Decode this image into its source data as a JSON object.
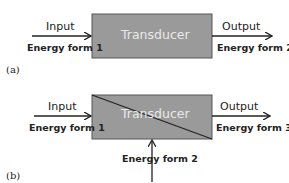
{
  "diagram_a": {
    "tag": "(a)",
    "box_label": "Transducer",
    "input_label": "Input",
    "input_energy": "Energy form 1",
    "output_label": "Output",
    "output_energy": "Energy form 2"
  },
  "diagram_b": {
    "tag": "(b)",
    "box_label": "Transducer",
    "input_label": "Input",
    "input_energy": "Energy form 1",
    "output_label": "Output",
    "output_energy": "Energy form 3",
    "auxiliary_energy": "Energy form 2"
  },
  "colors": {
    "box_fill": "#9a9a9a",
    "box_stroke": "#555555",
    "line": "#222222"
  }
}
